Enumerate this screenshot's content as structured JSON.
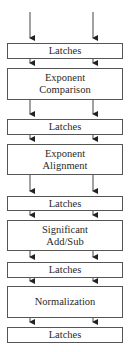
{
  "diagram": {
    "stages": [
      {
        "id": "latches-1",
        "label": "Latches",
        "top": 43,
        "height": 16
      },
      {
        "id": "exponent-comparison",
        "label": "Exponent Comparison",
        "line1": "Exponent",
        "line2": "Comparison",
        "top": 68,
        "height": 32
      },
      {
        "id": "latches-2",
        "label": "Latches",
        "top": 119,
        "height": 16
      },
      {
        "id": "exponent-alignment",
        "label": "Exponent Alignment",
        "line1": "Exponent",
        "line2": "Alignment",
        "top": 144,
        "height": 31
      },
      {
        "id": "latches-3",
        "label": "Latches",
        "top": 196,
        "height": 15
      },
      {
        "id": "significant-add-sub",
        "label": "Significant Add/Sub",
        "line1": "Significant",
        "line2": "Add/Sub",
        "top": 220,
        "height": 31
      },
      {
        "id": "latches-4",
        "label": "Latches",
        "top": 262,
        "height": 16
      },
      {
        "id": "normalization",
        "label": "Normalization",
        "top": 286,
        "height": 32
      },
      {
        "id": "latches-5",
        "label": "Latches",
        "top": 327,
        "height": 16
      }
    ],
    "arrow_x": [
      30,
      93
    ],
    "colors": {
      "line": "#555555",
      "text": "#2a2a2a",
      "background": "#ffffff"
    }
  }
}
